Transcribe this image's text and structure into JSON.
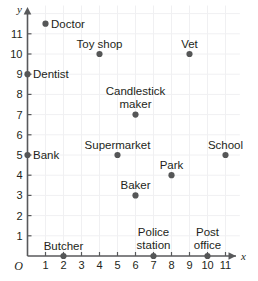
{
  "chart_data": {
    "type": "scatter",
    "title": "",
    "xlabel": "x",
    "ylabel": "y",
    "xlim": [
      0,
      11.8
    ],
    "ylim": [
      0,
      12.4
    ],
    "grid": true,
    "origin_label": "O",
    "xticks": [
      "1",
      "2",
      "3",
      "4",
      "5",
      "6",
      "7",
      "8",
      "9",
      "10",
      "11"
    ],
    "xtick_values": [
      1,
      2,
      3,
      4,
      5,
      6,
      7,
      8,
      9,
      10,
      11
    ],
    "yticks": [
      "1",
      "2",
      "3",
      "4",
      "5",
      "6",
      "7",
      "8",
      "9",
      "10",
      "11"
    ],
    "ytick_values": [
      1,
      2,
      3,
      4,
      5,
      6,
      7,
      8,
      9,
      10,
      11
    ],
    "points": [
      {
        "label": "Doctor",
        "x": 1,
        "y": 11.5,
        "label_lines": [
          "Doctor"
        ],
        "label_pos": "right"
      },
      {
        "label": "Toy shop",
        "x": 4,
        "y": 10,
        "label_lines": [
          "Toy shop"
        ],
        "label_pos": "above"
      },
      {
        "label": "Vet",
        "x": 9,
        "y": 10,
        "label_lines": [
          "Vet"
        ],
        "label_pos": "above"
      },
      {
        "label": "Dentist",
        "x": 0,
        "y": 9,
        "label_lines": [
          "Dentist"
        ],
        "label_pos": "right"
      },
      {
        "label": "Candlestick maker",
        "x": 6,
        "y": 7,
        "label_lines": [
          "Candlestick",
          "maker"
        ],
        "label_pos": "above2"
      },
      {
        "label": "Bank",
        "x": 0,
        "y": 5,
        "label_lines": [
          "Bank"
        ],
        "label_pos": "right"
      },
      {
        "label": "Supermarket",
        "x": 5,
        "y": 5,
        "label_lines": [
          "Supermarket"
        ],
        "label_pos": "above"
      },
      {
        "label": "School",
        "x": 11,
        "y": 5,
        "label_lines": [
          "School"
        ],
        "label_pos": "above"
      },
      {
        "label": "Park",
        "x": 8,
        "y": 4,
        "label_lines": [
          "Park"
        ],
        "label_pos": "above"
      },
      {
        "label": "Baker",
        "x": 6,
        "y": 3,
        "label_lines": [
          "Baker"
        ],
        "label_pos": "above"
      },
      {
        "label": "Butcher",
        "x": 2,
        "y": 0,
        "label_lines": [
          "Butcher"
        ],
        "label_pos": "above"
      },
      {
        "label": "Police station",
        "x": 7,
        "y": 0,
        "label_lines": [
          "Police",
          "station"
        ],
        "label_pos": "above2"
      },
      {
        "label": "Post office",
        "x": 10,
        "y": 0,
        "label_lines": [
          "Post",
          "office"
        ],
        "label_pos": "above2"
      }
    ],
    "colors": {
      "dot": "#555657",
      "axis": "#58595b",
      "grid": "#f0f0f2",
      "text": "#231f20",
      "background": "#ffffff"
    }
  }
}
